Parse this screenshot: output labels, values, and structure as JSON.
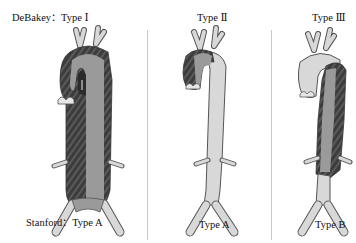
{
  "header": {
    "debakey_prefix": "DeBakey：",
    "panels": [
      {
        "type_label": "Type Ⅰ"
      },
      {
        "type_label": "Type Ⅱ"
      },
      {
        "type_label": "Type Ⅲ"
      }
    ]
  },
  "footer": {
    "stanford_prefix": "Stanford：",
    "panels": [
      {
        "type_label": "Type A"
      },
      {
        "type_label": "Type A"
      },
      {
        "type_label": "Type B"
      }
    ]
  },
  "colors": {
    "vessel_light": "#d8d8d8",
    "vessel_outline": "#555555",
    "true_lumen": "#9a9a9a",
    "false_lumen": "#3c3c3c",
    "stripe": "#555555",
    "divider": "#c8c8c8"
  }
}
